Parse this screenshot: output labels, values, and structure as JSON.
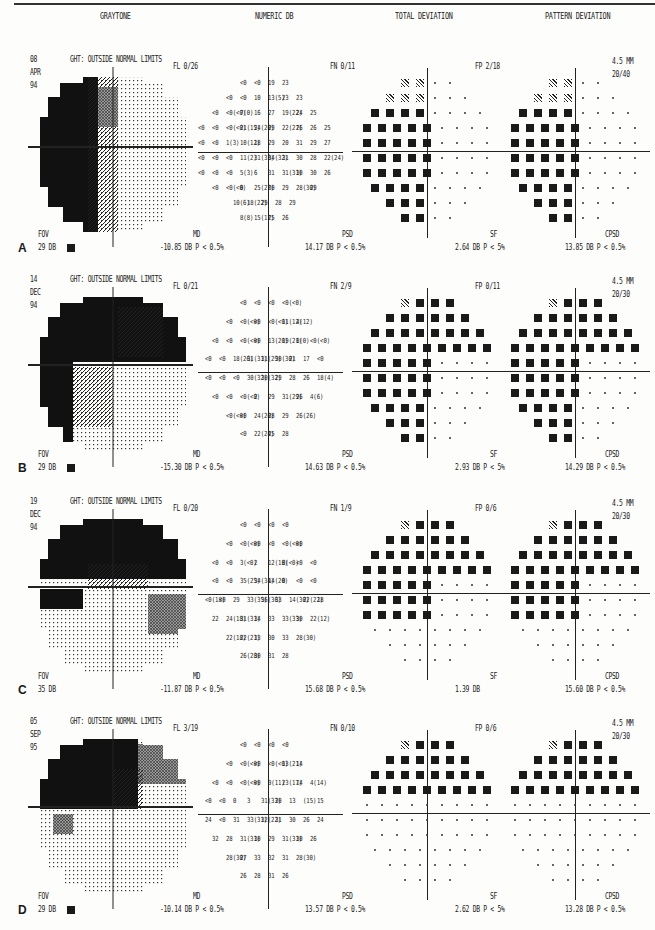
{
  "headers": {
    "graytone": "GRAYTONE",
    "numeric": "NUMERIC DB",
    "total": "TOTAL DEVIATION",
    "pattern": "PATTERN DEVIATION"
  },
  "panels": [
    {
      "label": "A",
      "day": "08",
      "month": "APR",
      "year": "94",
      "ght": "GHT: OUTSIDE NORMAL LIMITS",
      "fl": "FL  0/26",
      "fn": "FN  0/11",
      "fp": "FP  2/18",
      "pupil": "4.5 MM",
      "acuity": "20/40",
      "fov_label": "FOV",
      "fov_value": "29 DB",
      "md_label": "MD",
      "md_value": "-10.85 DB   P < 0.5%",
      "psd_label": "PSD",
      "psd_value": "14.17 DB   P < 0.5%",
      "sf_label": "SF",
      "sf_value": "2.64 DB   P <   5%",
      "cpsd_label": "CPSD",
      "cpsd_value": "13.85 DB   P < 0.5%",
      "numeric_rows": [
        [
          "<0",
          "<0",
          "19",
          "23"
        ],
        [
          "<0",
          "<0",
          "10",
          "13(5)",
          "23",
          "23"
        ],
        [
          "<0",
          "<0(<0)",
          "7(0)",
          "16",
          "27",
          "19(22)",
          "24",
          "25"
        ],
        [
          "<0",
          "<0",
          "<0(<0)",
          "21(15)",
          "24(20)",
          "29",
          "22(27)",
          "26",
          "26",
          "25"
        ],
        [
          "<0",
          "<0",
          "1(3)",
          "10(12)",
          "18",
          "29",
          "20",
          "31",
          "29",
          "27"
        ],
        [
          "<0",
          "<0",
          "<0",
          "11(2)",
          "31(33)",
          "34(32)",
          "31",
          "30",
          "28",
          "22(24)"
        ],
        [
          "<0",
          "<0",
          "<0",
          "5(3)",
          "6",
          "31",
          "31(31)",
          "30",
          "30",
          "26"
        ],
        [
          "<0",
          "<0(<0)",
          "0",
          "25(27)",
          "30",
          "29",
          "28(30)",
          "29"
        ],
        [
          "10(6)",
          "18(22)",
          "29",
          "28",
          "29"
        ],
        [
          "8(8)",
          "15(17)",
          "25",
          "26"
        ]
      ],
      "total_deviation": [
        "    ..% %|..   ",
        "   % % %|#..   ",
        "  # # # %|.:..  ",
        " # # # # :|.... ",
        " # #  # #|.:...",
        " # #  # .|.....",
        " # # # # #|.....",
        "   # # # :|....",
        "     # # %|...",
        "     % %|.."
      ],
      "pattern_deviation": [
        "    ..% %|..   ",
        "   % % %|#..   ",
        "  # # # %|....  ",
        " # # # # .|.....",
        " # #  # #|.....",
        " # #  # .|.....",
        " # # # # #|.....",
        "   # # # .|....",
        "     # # %|...",
        "     % %|.."
      ]
    },
    {
      "label": "B",
      "day": "14",
      "month": "DEC",
      "year": "94",
      "ght": "GHT: OUTSIDE NORMAL LIMITS",
      "fl": "FL  0/21",
      "fn": "FN  2/9",
      "fp": "FP  0/11",
      "pupil": "4.5 MM",
      "acuity": "20/30",
      "fov_label": "FOV",
      "fov_value": "29 DB",
      "md_label": "MD",
      "md_value": "-15.30 DB   P < 0.5%",
      "psd_label": "PSD",
      "psd_value": "14.63 DB   P < 0.5%",
      "sf_label": "SF",
      "sf_value": "2.93 DB   P <   5%",
      "cpsd_label": "CPSD",
      "cpsd_value": "14.29 DB   P < 0.5%",
      "numeric_rows": [
        [
          "<0",
          "<0",
          "<0",
          "<0(<0)"
        ],
        [
          "<0",
          "<0(<0)",
          "<0",
          "<0(<0)",
          "11(12)",
          "4(12)"
        ],
        [
          "<0",
          "<0",
          "<0(<0)",
          "<0",
          "13(20)",
          "19(21)",
          "0(0)",
          "<0(<0)"
        ],
        [
          "<0",
          "<0",
          "18(26)",
          "31(31)",
          "31(29)",
          "30(30)",
          "21",
          "17",
          "<0"
        ],
        [
          "<0",
          "<0",
          "<0",
          "30(32)",
          "30(32)",
          "29",
          "28",
          "26",
          "18(4)"
        ],
        [
          "<0",
          "<0",
          "<0(<0)",
          "2",
          "29",
          "31(29)",
          "26",
          "4(6)"
        ],
        [
          "<0(<0)",
          "<0",
          "24(20)",
          "28",
          "29",
          "26(26)"
        ],
        [
          "<0",
          "22(24)",
          "25",
          "28"
        ]
      ]
    },
    {
      "label": "C",
      "day": "19",
      "month": "DEC",
      "year": "94",
      "ght": "GHT: OUTSIDE NORMAL LIMITS",
      "fl": "FL  0/20",
      "fn": "FN  1/9",
      "fp": "FP  0/6",
      "pupil": "4.5 MM",
      "acuity": "20/30",
      "fov_label": "FOV",
      "fov_value": "35 DB",
      "md_label": "MD",
      "md_value": "-11.87 DB   P < 0.5%",
      "psd_label": "PSD",
      "psd_value": "15.68 DB   P < 0.5%",
      "sf_label": "SF",
      "sf_value": "1.39 DB",
      "cpsd_label": "CPSD",
      "cpsd_value": "15.60 DB   P < 0.5%",
      "numeric_rows": [
        [
          "<0",
          "<0",
          "<0",
          "<0"
        ],
        [
          "<0",
          "<0(<0)",
          "<0",
          "<0",
          "<0(<0)",
          "<0"
        ],
        [
          "<0",
          "<0",
          "3(<0)",
          "2",
          "12(18)",
          "0(<0)",
          "<0",
          "<0"
        ],
        [
          "<0",
          "<0",
          "35(25)",
          "34(34)",
          "14(20)",
          "0",
          "<0",
          "<0"
        ],
        [
          "<0(18)",
          "<0",
          "29",
          "33(35)",
          "36(36)",
          "33",
          "14(30)",
          "22(22)",
          "18"
        ],
        [
          "22",
          "24(18)",
          "31(31)",
          "34",
          "33",
          "33(33)",
          "30",
          "22(12)"
        ],
        [
          "22(18)",
          "22(21)",
          "33",
          "30",
          "33",
          "28(30)"
        ],
        [
          "26(28)",
          "30",
          "31",
          "28"
        ]
      ]
    },
    {
      "label": "D",
      "day": "05",
      "month": "SEP",
      "year": "95",
      "ght": "GHT: OUTSIDE NORMAL LIMITS",
      "fl": "FL  3/19",
      "fn": "FN  0/10",
      "fp": "FP  0/6",
      "pupil": "4.5 MM",
      "acuity": "20/30",
      "fov_label": "FOV",
      "fov_value": "29 DB",
      "md_label": "MD",
      "md_value": "-10.14 DB   P < 0.5%",
      "psd_label": "PSD",
      "psd_value": "13.57 DB   P < 0.5%",
      "sf_label": "SF",
      "sf_value": "2.62 DB   P <   5%",
      "cpsd_label": "CPSD",
      "cpsd_value": "13.28 DB   P < 0.5%",
      "numeric_rows": [
        [
          "<0",
          "<0",
          "<0",
          "<0"
        ],
        [
          "<0",
          "<0(<0)",
          "<0",
          "<0(<0)",
          "13(21)",
          "14"
        ],
        [
          "<0",
          "<0",
          "<0(<0)",
          "<0",
          "9(11)",
          "23(17)",
          "14",
          "4(14)"
        ],
        [
          "<0",
          "<0",
          "0",
          "3",
          "31(33)",
          "20",
          "13",
          "(15)",
          "15"
        ],
        [
          "24",
          "<0",
          "31",
          "33(31)",
          "32(22)",
          "31",
          "30",
          "26",
          "24"
        ],
        [
          "32",
          "28",
          "31(31)",
          "30",
          "29",
          "31(31)",
          "30",
          "26"
        ],
        [
          "28(30)",
          "27",
          "33",
          "32",
          "31",
          "28(30)"
        ],
        [
          "26",
          "28",
          "31",
          "26"
        ]
      ]
    }
  ]
}
